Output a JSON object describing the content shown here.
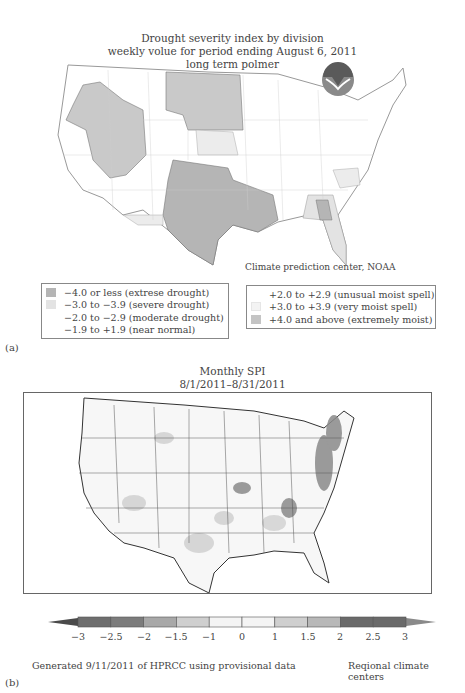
{
  "panel_a": {
    "label": "(a)",
    "title_lines": [
      "Drought severity index by division",
      "weekly volue for period ending August 6, 2011",
      "long term polmer"
    ],
    "logo": "noaa-logo",
    "credit": "Climate prediction center, NOAA",
    "legend_left": [
      {
        "label": "−4.0 or less (extrese drought)",
        "color": "#b5b5b5"
      },
      {
        "label": "−3.0 to −3.9 (severe drought)",
        "color": "#e3e3e3"
      },
      {
        "label": "−2.0 to −2.9 (moderate drought)",
        "color": "#ffffff"
      },
      {
        "label": "−1.9 to +1.9 (near normal)",
        "color": "#ffffff"
      }
    ],
    "legend_right": [
      {
        "label": "+2.0 to +2.9 (unusual moist spell)",
        "color": "#ffffff"
      },
      {
        "label": "+3.0 to +3.9 (very moist spell)",
        "color": "#f3f3f3"
      },
      {
        "label": "+4.0 and above (extremely moist)",
        "color": "#c4c4c4"
      }
    ]
  },
  "panel_b": {
    "label": "(b)",
    "title_lines": [
      "Monthly SPI",
      "8/1/2011–8/31/2011"
    ],
    "colorbar": {
      "ticks": [
        "−3",
        "−2.5",
        "−2",
        "−1.5",
        "−1",
        "0",
        "1",
        "1.5",
        "2",
        "2.5",
        "3"
      ],
      "segment_colors": [
        "#6e6e6e",
        "#7c7c7c",
        "#a8a8a8",
        "#cfcfcf",
        "#f4f4f4",
        "#f4f4f4",
        "#cfcfcf",
        "#b8b8b8",
        "#6a6a6a",
        "#6a6a6a"
      ],
      "left_arrow_color": "#4a4a4a",
      "right_arrow_color": "#8a8a8a"
    },
    "footer_left": "Generated 9/11/2011 of HPRCC using provisional data",
    "footer_right": "Reqional climate centers"
  }
}
